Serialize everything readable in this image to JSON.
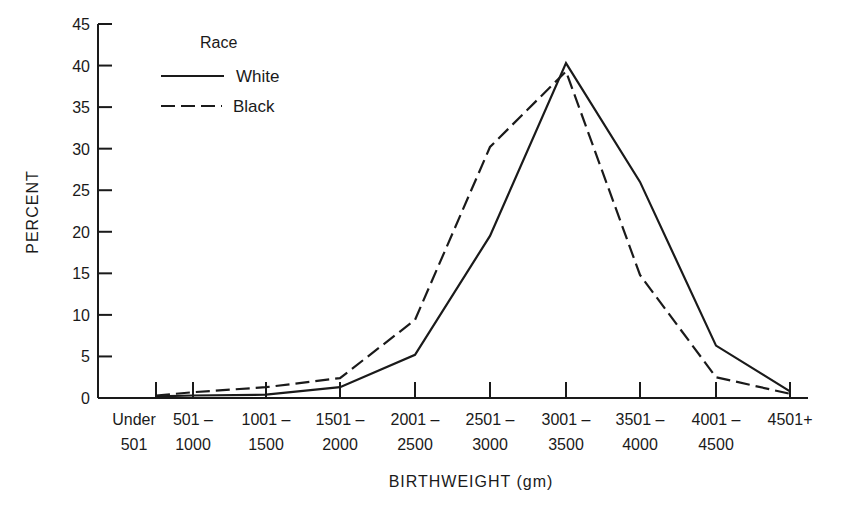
{
  "chart_data": {
    "type": "line",
    "title": "",
    "xlabel": "BIRTHWEIGHT (gm)",
    "ylabel": "PERCENT",
    "ylim": [
      0,
      45
    ],
    "yticks": [
      0,
      5,
      10,
      15,
      20,
      25,
      30,
      35,
      40,
      45
    ],
    "grid": false,
    "legend": {
      "title": "Race",
      "position": "upper-left",
      "entries": [
        {
          "label": "White",
          "style": "solid"
        },
        {
          "label": "Black",
          "style": "dashed"
        }
      ]
    },
    "categories": [
      [
        "Under",
        "501"
      ],
      [
        "501 –",
        "1000"
      ],
      [
        "1001 –",
        "1500"
      ],
      [
        "1501 –",
        "2000"
      ],
      [
        "2001 –",
        "2500"
      ],
      [
        "2501 –",
        "3000"
      ],
      [
        "3001 –",
        "3500"
      ],
      [
        "3501 –",
        "4000"
      ],
      [
        "4001 –",
        "4500"
      ],
      [
        "4501+",
        ""
      ]
    ],
    "series": [
      {
        "name": "White",
        "style": "solid",
        "values": [
          0.2,
          0.3,
          0.4,
          1.3,
          5.2,
          19.5,
          40.3,
          26.0,
          6.3,
          0.8
        ]
      },
      {
        "name": "Black",
        "style": "dashed",
        "values": [
          0.3,
          0.7,
          1.3,
          2.4,
          9.4,
          30.2,
          39.3,
          14.8,
          2.5,
          0.5
        ]
      }
    ]
  }
}
